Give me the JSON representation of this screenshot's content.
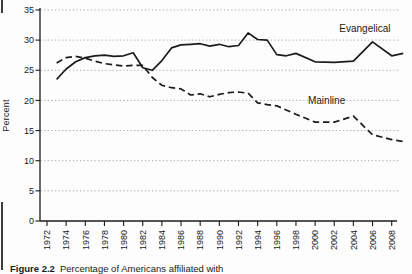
{
  "page": {
    "background": "#fdfdfd",
    "caption": {
      "prefix": "Figure 2.2",
      "text": "Percentage of Americans affiliated with"
    }
  },
  "chart_data": {
    "type": "line",
    "title": "",
    "xlabel": "",
    "ylabel": "Percent",
    "ylim": [
      0,
      35
    ],
    "xlim": [
      1972,
      2009.5
    ],
    "y_ticks": [
      0,
      5,
      10,
      15,
      20,
      25,
      30,
      35
    ],
    "x_ticks": [
      1972,
      1974,
      1976,
      1978,
      1980,
      1982,
      1984,
      1986,
      1988,
      1990,
      1992,
      1994,
      1996,
      1998,
      2000,
      2002,
      2004,
      2006,
      2008
    ],
    "grid": "horizontal dotted gridlines at every 5 percent",
    "legend": "inline labels next to lines",
    "line_color": "#1c1c1c",
    "grid_color": "#9c9c9c",
    "series": [
      {
        "name": "Evangelical",
        "style": "solid",
        "label_pos": {
          "year": 2005.2,
          "value": 31.4
        },
        "points": [
          [
            1973,
            23.5
          ],
          [
            1974,
            25.2
          ],
          [
            1975,
            26.4
          ],
          [
            1976,
            27.1
          ],
          [
            1977,
            27.4
          ],
          [
            1978,
            27.5
          ],
          [
            1979,
            27.3
          ],
          [
            1980,
            27.4
          ],
          [
            1981,
            27.9
          ],
          [
            1982,
            25.4
          ],
          [
            1983,
            25.0
          ],
          [
            1984,
            26.6
          ],
          [
            1985,
            28.7
          ],
          [
            1986,
            29.2
          ],
          [
            1987,
            29.3
          ],
          [
            1988,
            29.4
          ],
          [
            1989,
            29.0
          ],
          [
            1990,
            29.3
          ],
          [
            1991,
            28.9
          ],
          [
            1992,
            29.1
          ],
          [
            1993,
            31.2
          ],
          [
            1994,
            30.1
          ],
          [
            1995,
            30.0
          ],
          [
            1996,
            27.6
          ],
          [
            1997,
            27.4
          ],
          [
            1998,
            27.8
          ],
          [
            2000,
            26.4
          ],
          [
            2002,
            26.3
          ],
          [
            2004,
            26.5
          ],
          [
            2006,
            29.7
          ],
          [
            2008,
            27.4
          ],
          [
            2009.2,
            27.8
          ]
        ]
      },
      {
        "name": "Mainline",
        "style": "dashed",
        "label_pos": {
          "year": 2001.2,
          "value": 19.4
        },
        "points": [
          [
            1973,
            26.2
          ],
          [
            1974,
            27.1
          ],
          [
            1975,
            27.3
          ],
          [
            1976,
            27.0
          ],
          [
            1977,
            26.5
          ],
          [
            1978,
            26.1
          ],
          [
            1979,
            25.9
          ],
          [
            1980,
            25.7
          ],
          [
            1981,
            25.8
          ],
          [
            1982,
            25.8
          ],
          [
            1983,
            23.8
          ],
          [
            1984,
            22.5
          ],
          [
            1985,
            22.1
          ],
          [
            1986,
            21.9
          ],
          [
            1987,
            20.9
          ],
          [
            1988,
            21.1
          ],
          [
            1989,
            20.6
          ],
          [
            1990,
            21.0
          ],
          [
            1991,
            21.3
          ],
          [
            1992,
            21.4
          ],
          [
            1993,
            21.2
          ],
          [
            1994,
            19.6
          ],
          [
            1995,
            19.3
          ],
          [
            1996,
            19.1
          ],
          [
            1998,
            17.7
          ],
          [
            2000,
            16.4
          ],
          [
            2002,
            16.4
          ],
          [
            2004,
            17.4
          ],
          [
            2006,
            14.3
          ],
          [
            2008,
            13.5
          ],
          [
            2009.2,
            13.2
          ]
        ]
      }
    ]
  }
}
